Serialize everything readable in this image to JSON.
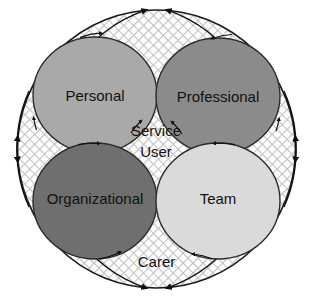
{
  "diagram": {
    "type": "venn-circles-with-cyclical-arrows",
    "background_color": "#ffffff",
    "outer": {
      "label": "Carer",
      "fill_pattern": "diagonal-crosshatch",
      "pattern_color": "#bfbfbf",
      "pattern_background": "#ffffff",
      "stroke_color": "#1a1a1a",
      "center": {
        "cx": 156.5,
        "cy": 149
      },
      "radius": 139,
      "label_position": {
        "x": 156.5,
        "y": 263
      },
      "arrow_count": 8,
      "arrow_direction": "bidirectional"
    },
    "center_label": {
      "line1": "Service",
      "line2": "User",
      "position": {
        "x": 156,
        "y": 137
      }
    },
    "inner_circles": [
      {
        "id": "personal",
        "label": "Personal",
        "fill": "#a9a9a9",
        "stroke": "#2b2b2b",
        "cx": 95,
        "cy": 95,
        "rx": 62,
        "ry": 58,
        "label_x": 95,
        "label_y": 97
      },
      {
        "id": "professional",
        "label": "Professional",
        "fill": "#8b8b8b",
        "stroke": "#2b2b2b",
        "cx": 218,
        "cy": 96,
        "rx": 62,
        "ry": 58,
        "label_x": 218,
        "label_y": 98
      },
      {
        "id": "organizational",
        "label": "Organizational",
        "fill": "#6f6f6f",
        "stroke": "#2b2b2b",
        "cx": 95,
        "cy": 201,
        "rx": 62,
        "ry": 58,
        "label_x": 95,
        "label_y": 200
      },
      {
        "id": "team",
        "label": "Team",
        "fill": "#dadada",
        "stroke": "#2b2b2b",
        "cx": 218,
        "cy": 201,
        "rx": 62,
        "ry": 58,
        "label_x": 218,
        "label_y": 200
      }
    ]
  }
}
